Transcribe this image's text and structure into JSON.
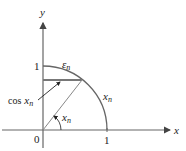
{
  "diagram": {
    "axes": {
      "x_label": "x",
      "y_label": "y",
      "origin_label": "0",
      "x_tick_label": "1",
      "y_tick_label": "1"
    },
    "labels": {
      "cos": "cos",
      "cos_var": "x",
      "cos_sub": "n",
      "epsilon": "ε",
      "epsilon_sub": "n",
      "arc_var": "x",
      "arc_sub": "n",
      "angle_var": "x",
      "angle_sub": "n"
    },
    "colors": {
      "axis": "#666666",
      "arc": "#555555",
      "text": "#222222"
    }
  }
}
